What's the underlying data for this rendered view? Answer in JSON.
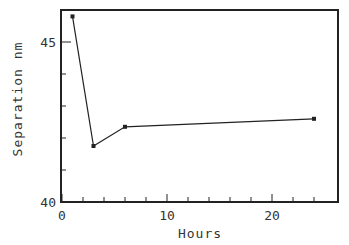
{
  "chart_data": {
    "type": "line",
    "title": "",
    "xlabel": "Hours",
    "ylabel": "Separation nm",
    "xlim": [
      0,
      26
    ],
    "ylim": [
      40,
      46
    ],
    "x_ticks_major": [
      0,
      10,
      20
    ],
    "x_ticks_minor_step": 2,
    "y_ticks_major": [
      40,
      45
    ],
    "y_ticks_minor_step": 1,
    "grid": false,
    "legend": null,
    "series": [
      {
        "name": "Separation",
        "x": [
          1,
          3,
          6,
          24
        ],
        "y": [
          45.8,
          41.75,
          42.35,
          42.6
        ],
        "marker": "square",
        "color": "#222222"
      }
    ]
  },
  "labels": {
    "xlabel": "Hours",
    "ylabel": "Separation nm",
    "xtick_0": "0",
    "xtick_10": "10",
    "xtick_20": "20",
    "ytick_40": "40",
    "ytick_45": "45"
  }
}
